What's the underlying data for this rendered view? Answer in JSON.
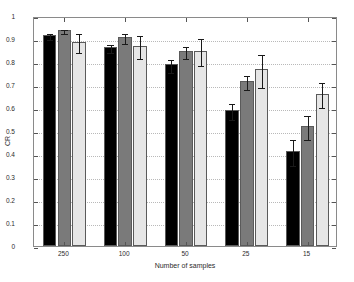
{
  "chart_data": {
    "type": "bar",
    "title": "",
    "xlabel": "Number of samples",
    "ylabel": "CR",
    "categories": [
      "250",
      "100",
      "50",
      "25",
      "15"
    ],
    "ylim": [
      0,
      1
    ],
    "yticks": [
      0,
      0.1,
      0.2,
      0.3,
      0.4,
      0.5,
      0.6,
      0.7,
      0.8,
      0.9,
      1
    ],
    "ytick_labels": [
      "0",
      "0.1",
      "0.2",
      "0.3",
      "0.4",
      "0.5",
      "0.6",
      "0.7",
      "0.8",
      "0.9",
      "1"
    ],
    "grid": true,
    "legend": "none",
    "series": [
      {
        "name": "series-1",
        "color": "#000000",
        "values": [
          0.918,
          0.866,
          0.791,
          0.591,
          0.412
        ],
        "errors": [
          0.012,
          0.017,
          0.028,
          0.035,
          0.056
        ]
      },
      {
        "name": "series-2",
        "color": "#7a7a7a",
        "values": [
          0.94,
          0.909,
          0.849,
          0.718,
          0.522
        ],
        "errors": [
          0.009,
          0.021,
          0.027,
          0.029,
          0.053
        ]
      },
      {
        "name": "series-3",
        "color": "#e6e6e6",
        "values": [
          0.889,
          0.871,
          0.85,
          0.768,
          0.663
        ],
        "errors": [
          0.04,
          0.05,
          0.057,
          0.071,
          0.053
        ]
      }
    ]
  }
}
